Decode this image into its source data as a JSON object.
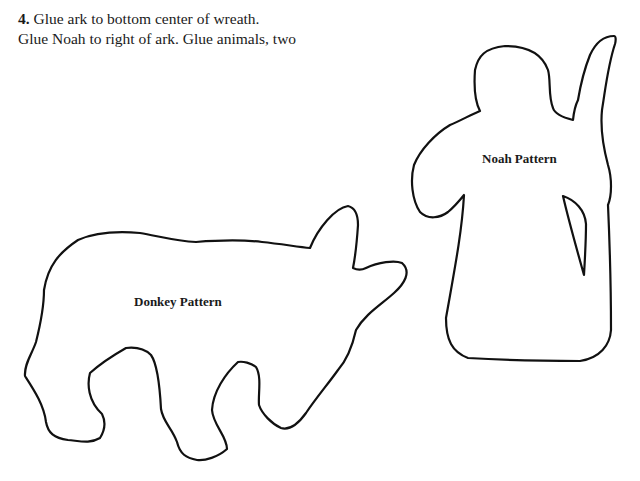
{
  "instructions": {
    "step_number": "4.",
    "line1": "Glue ark to bottom center of wreath.",
    "line2": "Glue Noah to right of ark. Glue animals, two"
  },
  "patterns": [
    {
      "name": "donkey",
      "label": "Donkey Pattern"
    },
    {
      "name": "noah",
      "label": "Noah Pattern"
    }
  ],
  "colors": {
    "outline": "#111111",
    "background": "#ffffff"
  }
}
